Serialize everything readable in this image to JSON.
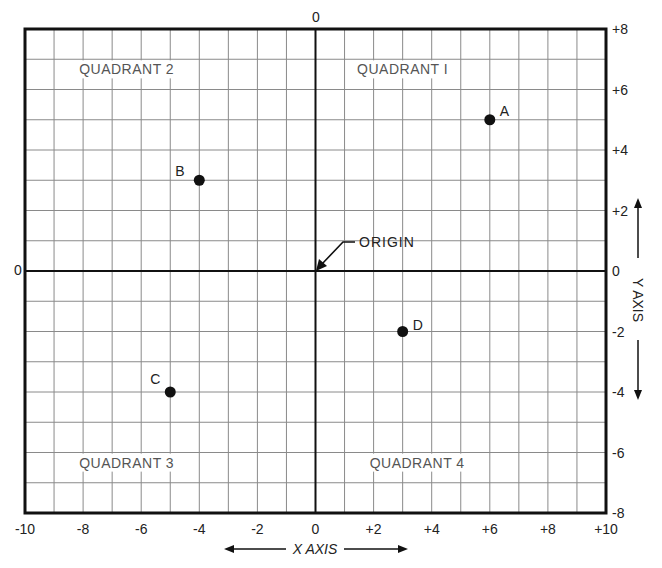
{
  "chart_data": {
    "type": "scatter",
    "title": "",
    "xlabel": "X AXIS",
    "ylabel": "Y AXIS",
    "xlim": [
      -10,
      10
    ],
    "ylim": [
      -8,
      8
    ],
    "grid": true,
    "x_ticks": [
      "-10",
      "-8",
      "-6",
      "-4",
      "-2",
      "0",
      "+2",
      "+4",
      "+6",
      "+8",
      "+10"
    ],
    "y_ticks": [
      "+8",
      "+6",
      "+4",
      "+2",
      "0",
      "-2",
      "-4",
      "-6",
      "-8"
    ],
    "top_zero_label": "0",
    "left_zero_label": "0",
    "points": [
      {
        "label": "A",
        "x": 6,
        "y": 5
      },
      {
        "label": "B",
        "x": -4,
        "y": 3
      },
      {
        "label": "C",
        "x": -5,
        "y": -4
      },
      {
        "label": "D",
        "x": 3,
        "y": -2
      }
    ],
    "quadrants": [
      {
        "label": "QUADRANT I",
        "x": 3,
        "y": 6.5
      },
      {
        "label": "QUADRANT 2",
        "x": -6.5,
        "y": 6.5
      },
      {
        "label": "QUADRANT 3",
        "x": -6.5,
        "y": -6.5
      },
      {
        "label": "QUADRANT 4",
        "x": 3.5,
        "y": -6.5
      }
    ],
    "annotations": [
      {
        "text": "ORIGIN",
        "arrow_to": [
          0,
          0
        ]
      }
    ]
  },
  "labels": {
    "x_axis": "X AXIS",
    "y_axis": "Y AXIS",
    "origin": "ORIGIN"
  }
}
